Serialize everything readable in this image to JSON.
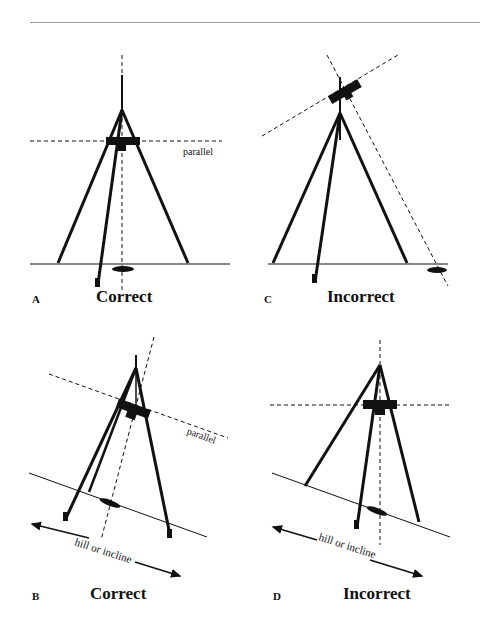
{
  "panels": [
    {
      "letter": "A",
      "caption": "Correct",
      "annotation": "parallel"
    },
    {
      "letter": "C",
      "caption": "Incorrect"
    },
    {
      "letter": "B",
      "caption": "Correct",
      "annotation": "parallel",
      "ground_label": "hill or incline"
    },
    {
      "letter": "D",
      "caption": "Incorrect",
      "ground_label": "hill or incline"
    }
  ],
  "colors": {
    "ink": "#111111",
    "rule": "#999999",
    "background": "#ffffff"
  }
}
